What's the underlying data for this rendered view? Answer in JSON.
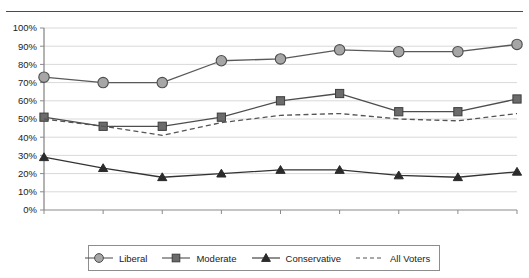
{
  "chart_data": {
    "type": "line",
    "title": "",
    "subtitle": "",
    "xlabel": "",
    "ylabel": "",
    "categories": [
      "1976",
      "1980",
      "1984",
      "1988",
      "1992",
      "1996",
      "2000",
      "2004",
      "2008"
    ],
    "x": [
      1976,
      1980,
      1984,
      1988,
      1992,
      1996,
      2000,
      2004,
      2008
    ],
    "ylim": [
      0,
      100
    ],
    "ytick_labels": [
      "0%",
      "10%",
      "20%",
      "30%",
      "40%",
      "50%",
      "60%",
      "70%",
      "80%",
      "90%",
      "100%"
    ],
    "ytick_values": [
      0,
      10,
      20,
      30,
      40,
      50,
      60,
      70,
      80,
      90,
      100
    ],
    "grid": "horizontal",
    "legend_position": "bottom",
    "series": [
      {
        "name": "Liberal",
        "marker": "circle",
        "line_style": "solid",
        "color": "#595959",
        "marker_fill": "#a6a6a6",
        "values": [
          73,
          70,
          70,
          82,
          83,
          88,
          87,
          87,
          91
        ]
      },
      {
        "name": "Moderate",
        "marker": "square",
        "line_style": "solid",
        "color": "#4d4d4d",
        "marker_fill": "#6b6b6b",
        "values": [
          51,
          46,
          46,
          51,
          60,
          64,
          54,
          54,
          61
        ]
      },
      {
        "name": "Conservative",
        "marker": "triangle",
        "line_style": "solid",
        "color": "#333333",
        "marker_fill": "#2b2b2b",
        "values": [
          29,
          23,
          18,
          20,
          22,
          22,
          19,
          18,
          21
        ]
      },
      {
        "name": "All Voters",
        "marker": "none",
        "line_style": "dashed",
        "color": "#555555",
        "marker_fill": "none",
        "values": [
          50,
          46,
          41,
          48,
          52,
          53,
          50,
          49,
          53
        ]
      }
    ]
  },
  "legend": {
    "items": [
      {
        "label": "Liberal",
        "marker": "circle-marker"
      },
      {
        "label": "Moderate",
        "marker": "square-marker"
      },
      {
        "label": "Conservative",
        "marker": "triangle-marker"
      },
      {
        "label": "All Voters",
        "marker": "dashed-line-marker"
      }
    ]
  },
  "colors": {
    "axis": "#8a8a8a",
    "grid": "#d9d9d9",
    "text": "#1b1b1b",
    "top_rule": "#4a4a4a",
    "legend_border": "#8d8d8d"
  }
}
